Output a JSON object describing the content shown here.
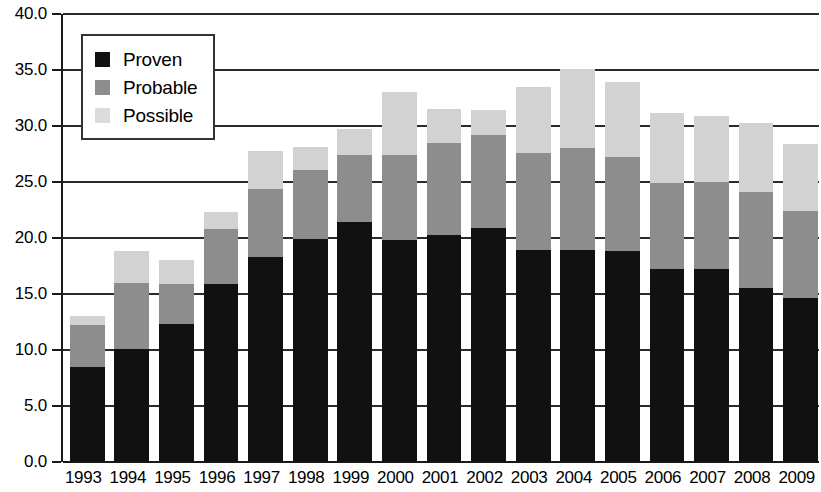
{
  "chart_data": {
    "type": "bar",
    "stacked": true,
    "title": "",
    "subtitle": "",
    "xlabel": "",
    "ylabel": "",
    "ylim": [
      0.0,
      40.0
    ],
    "ytick_step": 5.0,
    "grid": true,
    "legend_position": "top-left",
    "categories": [
      "1993",
      "1994",
      "1995",
      "1996",
      "1997",
      "1998",
      "1999",
      "2000",
      "2001",
      "2002",
      "2003",
      "2004",
      "2005",
      "2006",
      "2007",
      "2008",
      "2009"
    ],
    "ytick_labels": [
      "0.0",
      "5.0",
      "10.0",
      "15.0",
      "20.0",
      "25.0",
      "30.0",
      "35.0",
      "40.0"
    ],
    "ytick_values": [
      0.0,
      5.0,
      10.0,
      15.0,
      20.0,
      25.0,
      30.0,
      35.0,
      40.0
    ],
    "series": [
      {
        "name": "Proven",
        "color": "#111111",
        "values": [
          8.5,
          10.1,
          12.3,
          15.9,
          18.3,
          19.9,
          21.4,
          19.8,
          20.3,
          20.9,
          18.9,
          18.9,
          18.8,
          17.2,
          17.2,
          15.5,
          14.6
        ]
      },
      {
        "name": "Probable",
        "color": "#8d8d8d",
        "values": [
          3.7,
          5.9,
          3.6,
          4.9,
          6.1,
          6.2,
          6.0,
          7.6,
          8.2,
          8.3,
          8.7,
          9.1,
          8.4,
          7.7,
          7.8,
          8.6,
          7.8
        ]
      },
      {
        "name": "Possible",
        "color": "#d2d2d2",
        "values": [
          0.8,
          2.8,
          2.1,
          1.5,
          3.4,
          2.0,
          2.3,
          5.6,
          3.0,
          2.2,
          5.9,
          7.1,
          6.7,
          6.3,
          5.9,
          6.2,
          6.0
        ]
      }
    ],
    "totals": [
      13.0,
      18.8,
      18.0,
      22.3,
      27.8,
      28.1,
      29.7,
      33.0,
      34.6,
      35.4,
      33.5,
      35.1,
      33.9,
      31.2,
      30.9,
      30.3,
      28.4
    ]
  },
  "legend": {
    "items": [
      {
        "label": "Proven",
        "swatch": "proven-swatch-icon"
      },
      {
        "label": "Probable",
        "swatch": "probable-swatch-icon"
      },
      {
        "label": "Possible",
        "swatch": "possible-swatch-icon"
      }
    ]
  }
}
